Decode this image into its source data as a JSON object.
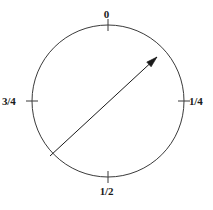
{
  "figure": {
    "background_color": "#ffffff",
    "stroke_color": "#3a3a3a",
    "text_color": "#1a1a1a"
  },
  "circle": {
    "center_x": 108,
    "center_y": 101,
    "radius": 76,
    "stroke_width": 1
  },
  "labels": {
    "top": "0",
    "right": "1/4",
    "bottom": "1/2",
    "left": "3/4"
  },
  "ticks": [
    {
      "name": "tick-0",
      "angle_turns": 0,
      "x1": 108,
      "y1": 19,
      "x2": 108,
      "y2": 31
    },
    {
      "name": "tick-1-4",
      "angle_turns": 0.25,
      "x1": 178,
      "y1": 101,
      "x2": 190,
      "y2": 101
    },
    {
      "name": "tick-1-2",
      "angle_turns": 0.5,
      "x1": 108,
      "y1": 171,
      "x2": 108,
      "y2": 183
    },
    {
      "name": "tick-3-4",
      "angle_turns": 0.75,
      "x1": 26,
      "y1": 101,
      "x2": 38,
      "y2": 101
    }
  ],
  "arrow": {
    "name": "direction-arrow",
    "tail_x": 50,
    "tail_y": 156,
    "tip_x": 157,
    "tip_y": 57,
    "stroke_width": 1,
    "head_length": 11,
    "head_half_width": 3.2
  },
  "chart_data": {
    "type": "scatter",
    "title": "",
    "xlabel": "",
    "ylabel": "",
    "categories": [
      "0",
      "1/4",
      "1/2",
      "3/4"
    ],
    "values": [
      0,
      0.25,
      0.5,
      0.75
    ],
    "annotations": [
      "arrow drawn from lower-left circumference to upper-right circumference",
      "arrow points toward approximately the 1/8 turn position"
    ],
    "grid": false,
    "legend_position": "none"
  }
}
